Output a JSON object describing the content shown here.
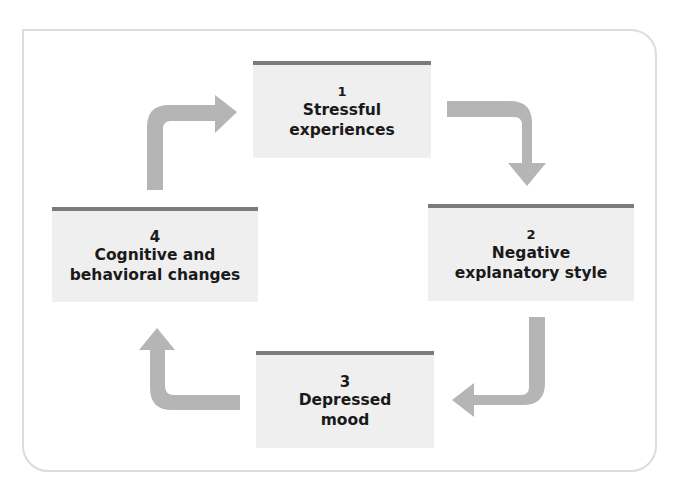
{
  "diagram": {
    "type": "cycle",
    "colors": {
      "frame": "#dcdcdc",
      "box_fill": "#efefef",
      "box_top_bar": "#7b7b7b",
      "arrow": "#b5b5b5",
      "text": "#1a1a1a"
    },
    "nodes": [
      {
        "number": "1",
        "line1": "Stressful",
        "line2": "experiences"
      },
      {
        "number": "2",
        "line1": "Negative",
        "line2": "explanatory style"
      },
      {
        "number": "3",
        "line1": "Depressed",
        "line2": "mood"
      },
      {
        "number": "4",
        "line1": "Cognitive and",
        "line2": "behavioral changes"
      }
    ],
    "edges": [
      {
        "from": "1",
        "to": "2"
      },
      {
        "from": "2",
        "to": "3"
      },
      {
        "from": "3",
        "to": "4"
      },
      {
        "from": "4",
        "to": "1"
      }
    ]
  }
}
